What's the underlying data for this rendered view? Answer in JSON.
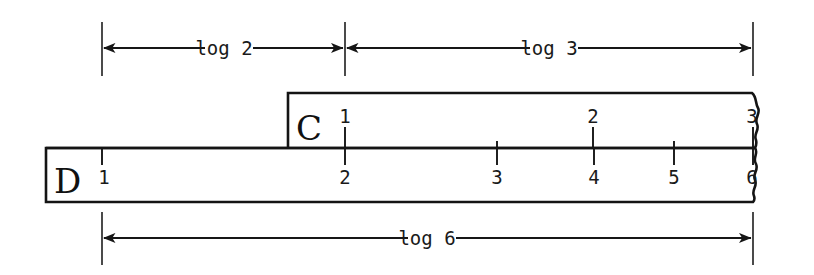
{
  "figure": {
    "background_color": "#ffffff",
    "ink_color": "#161616",
    "width": 814,
    "height": 275
  },
  "dimensions": [
    {
      "id": "log2",
      "label": "log 2",
      "position": "top-left",
      "x_start": 102,
      "x_end": 345,
      "y": 48,
      "label_x": 224,
      "label_y": 54
    },
    {
      "id": "log3",
      "label": "log 3",
      "position": "top-right",
      "x_start": 345,
      "x_end": 753,
      "y": 48,
      "label_x": 549,
      "label_y": 54
    },
    {
      "id": "log6",
      "label": "log 6",
      "position": "bottom",
      "x_start": 102,
      "x_end": 753,
      "y": 238,
      "label_x": 427,
      "label_y": 244
    }
  ],
  "scales": [
    {
      "id": "C",
      "letter": "C",
      "letter_x": 296,
      "letter_y": 137,
      "rect": {
        "x": 288,
        "y": 93,
        "width": 470,
        "height": 55
      },
      "ticks": [
        {
          "label": "1",
          "x": 345,
          "major": true
        },
        {
          "label": "2",
          "x": 593,
          "major": true
        },
        {
          "label": "3",
          "x": 753,
          "major": true
        }
      ],
      "minor_ticks": [
        {
          "x": 497
        },
        {
          "x": 674
        }
      ],
      "label_y": 122,
      "torn_edge": "right"
    },
    {
      "id": "D",
      "letter": "D",
      "letter_x": 54,
      "letter_y": 191,
      "rect": {
        "x": 46,
        "y": 148,
        "width": 712,
        "height": 54
      },
      "ticks": [
        {
          "label": "1",
          "x": 102,
          "major": true
        },
        {
          "label": "2",
          "x": 345,
          "major": true
        },
        {
          "label": "3",
          "x": 497,
          "major": true
        },
        {
          "label": "4",
          "x": 594,
          "major": true
        },
        {
          "label": "5",
          "x": 674,
          "major": true
        },
        {
          "label": "6",
          "x": 753,
          "major": true
        }
      ],
      "minor_ticks": [],
      "label_y": 178,
      "torn_edge": "right"
    }
  ],
  "extension_lines": [
    {
      "id": "left-top",
      "x": 102,
      "y_top": 22,
      "y_bottom": 76
    },
    {
      "id": "middle-top",
      "x": 345,
      "y_top": 22,
      "y_bottom": 76
    },
    {
      "id": "right-top",
      "x": 753,
      "y_top": 22,
      "y_bottom": 76
    },
    {
      "id": "left-bottom",
      "x": 102,
      "y_top": 212,
      "y_bottom": 265
    },
    {
      "id": "right-bottom",
      "x": 753,
      "y_top": 212,
      "y_bottom": 265
    }
  ],
  "icons": {
    "arrow_left": "arrow-left-icon",
    "arrow_right": "arrow-right-icon",
    "torn_edge": "torn-edge-icon"
  }
}
